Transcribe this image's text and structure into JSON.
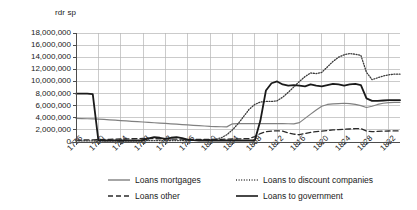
{
  "chart_data": {
    "type": "line",
    "title": "",
    "ylabel": "rdr sp",
    "xlabel": "",
    "ylim": [
      0,
      18000000
    ],
    "xlim": [
      1776,
      1834
    ],
    "grid": true,
    "legend_position": "bottom",
    "ytick_labels": [
      "18,000,000",
      "16,000,000",
      "14,000,000",
      "12,000,000",
      "10,000,000",
      "8,000,000",
      "6,000,000",
      "4,000,000",
      "2,000,000",
      "0"
    ],
    "ytick_values": [
      18000000,
      16000000,
      14000000,
      12000000,
      10000000,
      8000000,
      6000000,
      4000000,
      2000000,
      0
    ],
    "xtick_labels": [
      "1776",
      "1780",
      "1784",
      "1788",
      "1792",
      "1796",
      "1800",
      "1804",
      "1808",
      "1812",
      "1816",
      "1820",
      "1824",
      "1828",
      "1832"
    ],
    "xtick_values": [
      1776,
      1780,
      1784,
      1788,
      1792,
      1796,
      1800,
      1804,
      1808,
      1812,
      1816,
      1820,
      1824,
      1828,
      1832
    ],
    "x": [
      1776,
      1777,
      1778,
      1779,
      1780,
      1781,
      1782,
      1783,
      1784,
      1785,
      1786,
      1787,
      1788,
      1789,
      1790,
      1791,
      1792,
      1793,
      1794,
      1795,
      1796,
      1797,
      1798,
      1799,
      1800,
      1801,
      1802,
      1803,
      1804,
      1805,
      1806,
      1807,
      1808,
      1809,
      1810,
      1811,
      1812,
      1813,
      1814,
      1815,
      1816,
      1817,
      1818,
      1819,
      1820,
      1821,
      1822,
      1823,
      1824,
      1825,
      1826,
      1827,
      1828,
      1829,
      1830,
      1831,
      1832,
      1833,
      1834
    ],
    "series": [
      {
        "name": "Loans mortgages",
        "style": "solid",
        "color": "#808080",
        "width": 1.2,
        "values": [
          3900000,
          3870000,
          3840000,
          3810000,
          3780000,
          3720000,
          3660000,
          3600000,
          3540000,
          3480000,
          3420000,
          3360000,
          3300000,
          3240000,
          3180000,
          3120000,
          3060000,
          3000000,
          2940000,
          2880000,
          2820000,
          2760000,
          2700000,
          2640000,
          2580000,
          2540000,
          2520000,
          2500000,
          3000000,
          3020000,
          3030000,
          3040000,
          3050000,
          3050000,
          3040000,
          3030000,
          3020000,
          3020000,
          3010000,
          3000000,
          3200000,
          3900000,
          4600000,
          5300000,
          5900000,
          6200000,
          6300000,
          6350000,
          6400000,
          6350000,
          6200000,
          6000000,
          5700000,
          5900000,
          6200000,
          6400000,
          6500000,
          6550000,
          6550000
        ]
      },
      {
        "name": "Loans to discount companies",
        "style": "dotted",
        "color": "#3a3a3a",
        "width": 1.3,
        "values": [
          180000,
          180000,
          180000,
          180000,
          180000,
          180000,
          190000,
          190000,
          200000,
          200000,
          200000,
          210000,
          210000,
          220000,
          220000,
          230000,
          230000,
          240000,
          240000,
          250000,
          250000,
          260000,
          270000,
          300000,
          350000,
          450000,
          700000,
          1200000,
          2000000,
          3000000,
          4200000,
          5400000,
          6200000,
          6600000,
          6700000,
          6700000,
          6800000,
          7400000,
          8200000,
          9100000,
          10000000,
          10800000,
          11400000,
          11300000,
          11500000,
          12400000,
          13300000,
          14000000,
          14400000,
          14600000,
          14500000,
          14300000,
          11500000,
          10300000,
          10600000,
          10900000,
          11100000,
          11200000,
          11200000
        ]
      },
      {
        "name": "Loans other",
        "style": "dashed",
        "color": "#2a2a2a",
        "width": 1.3,
        "values": [
          300000,
          320000,
          340000,
          360000,
          400000,
          420000,
          450000,
          470000,
          500000,
          520000,
          540000,
          560000,
          580000,
          560000,
          540000,
          520000,
          500000,
          480000,
          470000,
          460000,
          450000,
          440000,
          430000,
          420000,
          420000,
          430000,
          450000,
          470000,
          500000,
          520000,
          540000,
          560000,
          900000,
          1400000,
          1700000,
          1800000,
          1850000,
          1800000,
          1500000,
          1300000,
          1200000,
          1400000,
          1600000,
          1700000,
          1800000,
          1900000,
          2000000,
          2050000,
          2100000,
          2150000,
          2200000,
          2200000,
          1800000,
          1700000,
          1750000,
          1800000,
          1820000,
          1830000,
          1830000
        ]
      },
      {
        "name": "Loans to government",
        "style": "solid",
        "color": "#1a1a1a",
        "width": 1.8,
        "values": [
          8000000,
          8000000,
          8000000,
          7900000,
          300000,
          250000,
          250000,
          250000,
          250000,
          250000,
          250000,
          250000,
          300000,
          600000,
          800000,
          700000,
          500000,
          700000,
          800000,
          650000,
          400000,
          300000,
          250000,
          250000,
          250000,
          250000,
          250000,
          250000,
          250000,
          250000,
          250000,
          250000,
          250000,
          3500000,
          8500000,
          9700000,
          10000000,
          9500000,
          9300000,
          9400000,
          9300000,
          9200000,
          9500000,
          9300000,
          9200000,
          9400000,
          9600000,
          9500000,
          9300000,
          9500000,
          9600000,
          9400000,
          7200000,
          6800000,
          6800000,
          6850000,
          6900000,
          6900000,
          6900000
        ]
      }
    ]
  },
  "legend": {
    "entries": [
      {
        "label": "Loans mortgages",
        "marker": "solid-line-gray"
      },
      {
        "label": "Loans to discount companies",
        "marker": "dotted-line"
      },
      {
        "label": "Loans other",
        "marker": "dashed-line"
      },
      {
        "label": "Loans to government",
        "marker": "solid-line-black"
      }
    ]
  },
  "plot_area": {
    "left": 76,
    "top": 33,
    "right": 400,
    "bottom": 142
  }
}
